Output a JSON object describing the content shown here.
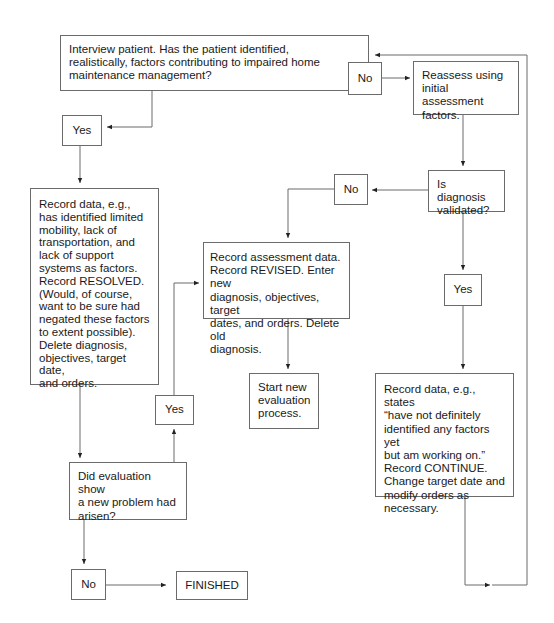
{
  "diagram": {
    "type": "flowchart",
    "nodes": {
      "interview": "Interview patient. Has the patient identified,\nrealistically, factors contributing to impaired home\nmaintenance management?",
      "no_top": "No",
      "reassess": "Reassess using\ninitial assessment\nfactors.",
      "yes_top": "Yes",
      "resolved": "Record data, e.g.,\nhas identified limited\nmobility, lack of\ntransportation, and\nlack of support\nsystems as factors.\nRecord RESOLVED.\n(Would, of course,\nwant to be sure had\nnegated these factors\nto extent possible).\nDelete diagnosis,\nobjectives, target date,\nand orders.",
      "validated": "Is diagnosis\nvalidated?",
      "no_mid": "No",
      "revised": "Record assessment data.\nRecord REVISED. Enter new\ndiagnosis, objectives, target\ndates, and orders. Delete old\ndiagnosis.",
      "start_new": "Start new\nevaluation\nprocess.",
      "yes_right": "Yes",
      "continue": "Record data, e.g., states\n“have not definitely\nidentified any factors yet\nbut am working on.”\nRecord CONTINUE.\nChange target date and\nmodify orders as\nnecessary.",
      "yes_left": "Yes",
      "new_problem": "Did evaluation show\na new problem had\narisen?",
      "no_bottom": "No",
      "finished": "FINISHED"
    },
    "edges": [
      {
        "from": "interview",
        "to": "no_top"
      },
      {
        "from": "no_top",
        "to": "reassess"
      },
      {
        "from": "interview",
        "to": "yes_top"
      },
      {
        "from": "yes_top",
        "to": "resolved"
      },
      {
        "from": "reassess",
        "to": "validated"
      },
      {
        "from": "validated",
        "to": "no_mid"
      },
      {
        "from": "no_mid",
        "to": "revised"
      },
      {
        "from": "revised",
        "to": "start_new"
      },
      {
        "from": "validated",
        "to": "yes_right"
      },
      {
        "from": "yes_right",
        "to": "continue"
      },
      {
        "from": "continue",
        "to": "interview"
      },
      {
        "from": "resolved",
        "to": "new_problem"
      },
      {
        "from": "new_problem",
        "to": "yes_left"
      },
      {
        "from": "yes_left",
        "to": "revised"
      },
      {
        "from": "new_problem",
        "to": "no_bottom"
      },
      {
        "from": "no_bottom",
        "to": "finished"
      }
    ],
    "colors": {
      "line": "#6b6b6b",
      "text": "#1a1a1a",
      "background": "#ffffff"
    }
  }
}
